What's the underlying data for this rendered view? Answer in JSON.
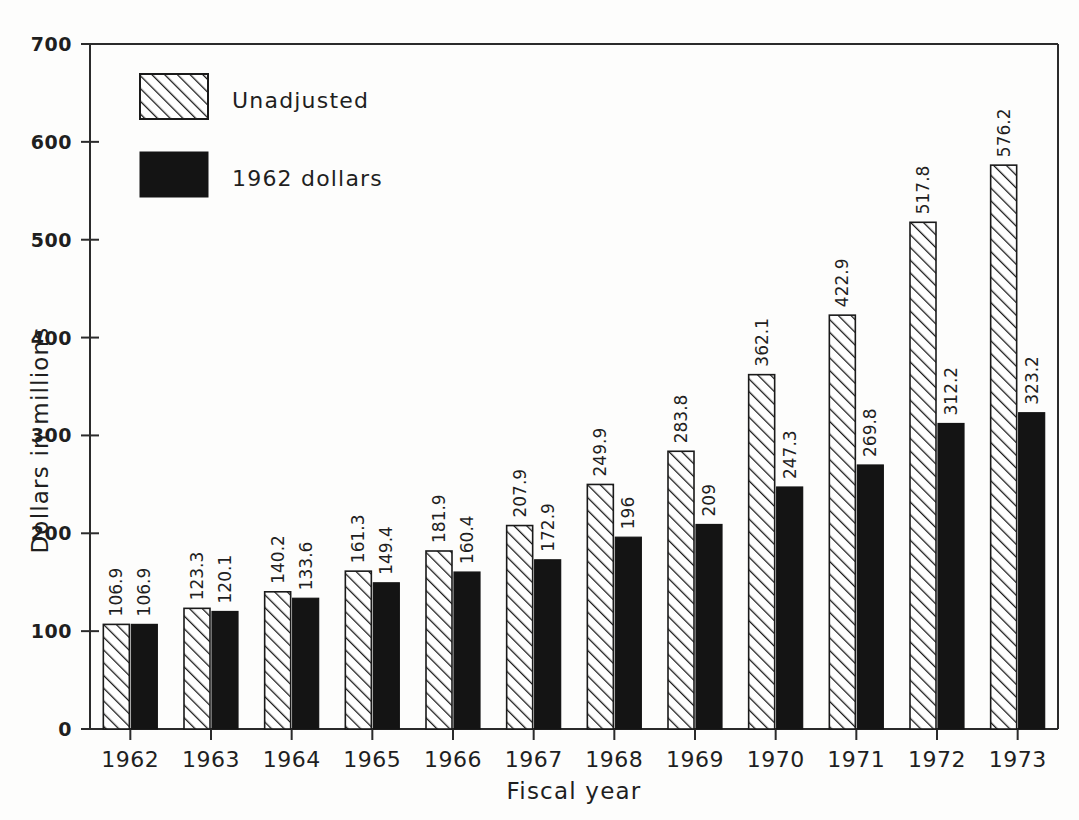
{
  "chart_data": {
    "type": "bar",
    "title": "",
    "xlabel": "Fiscal year",
    "ylabel": "Dollars in millions",
    "categories": [
      "1962",
      "1963",
      "1964",
      "1965",
      "1966",
      "1967",
      "1968",
      "1969",
      "1970",
      "1971",
      "1972",
      "1973"
    ],
    "series": [
      {
        "name": "Unadjusted",
        "pattern": "diagonal-hatch",
        "color": "#ffffff",
        "values": [
          106.9,
          123.3,
          140.2,
          161.3,
          181.9,
          207.9,
          249.9,
          283.8,
          362.1,
          422.9,
          517.8,
          576.2
        ],
        "labels": [
          "106.9",
          "123.3",
          "140.2",
          "161.3",
          "181.9",
          "207.9",
          "249.9",
          "283.8",
          "362.1",
          "422.9",
          "517.8",
          "576.2"
        ]
      },
      {
        "name": "1962 dollars",
        "pattern": "solid",
        "color": "#141414",
        "values": [
          106.9,
          120.1,
          133.6,
          149.4,
          160.4,
          172.9,
          196,
          209,
          247.3,
          269.8,
          312.2,
          323.2
        ],
        "labels": [
          "106.9",
          "120.1",
          "133.6",
          "149.4",
          "160.4",
          "172.9",
          "196",
          "209",
          "247.3",
          "269.8",
          "312.2",
          "323.2"
        ]
      }
    ],
    "ylim": [
      0,
      700
    ],
    "yticks": [
      0,
      100,
      200,
      300,
      400,
      500,
      600,
      700
    ],
    "ytick_labels": [
      "0",
      "100",
      "200",
      "300",
      "400",
      "500",
      "600",
      "700"
    ],
    "grid": false,
    "legend_position": "top-left",
    "legend": [
      {
        "label": "Unadjusted",
        "pattern": "diagonal-hatch"
      },
      {
        "label": "1962 dollars",
        "pattern": "solid"
      }
    ]
  },
  "colors": {
    "background": "#fdfdfc",
    "axis": "#2b2b2b",
    "bar_solid": "#141414",
    "bar_hatch_stroke": "#1a1a1a",
    "text": "#1f1f1f"
  }
}
